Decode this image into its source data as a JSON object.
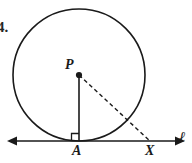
{
  "figure": {
    "type": "geometry-diagram",
    "width": 192,
    "height": 163,
    "background_color": "#ffffff",
    "stroke_color": "#1a1a1a",
    "problem_number": "4.",
    "labels": {
      "center": "P",
      "tangent_point": "A",
      "exterior_point": "X",
      "line": "ℓ"
    },
    "circle": {
      "center_x": 79,
      "center_y": 75,
      "radius": 66,
      "stroke_width": 1.6,
      "fill": "none"
    },
    "line_l": {
      "x1": 8,
      "y1": 141,
      "x2": 184,
      "y2": 141,
      "stroke_width": 1.6,
      "arrows": "both"
    },
    "radius_segment": {
      "label": "PA",
      "x1": 79,
      "y1": 75,
      "x2": 79,
      "y2": 141,
      "style": "solid",
      "stroke_width": 1.6
    },
    "dashed_segment": {
      "label": "PX",
      "x1": 79,
      "y1": 75,
      "x2": 150,
      "y2": 141,
      "style": "dashed",
      "dash_pattern": "4,3",
      "stroke_width": 1.4
    },
    "center_dot": {
      "cx": 79,
      "cy": 75,
      "r": 3.1
    },
    "right_angle_mark": {
      "at": "A",
      "size": 8,
      "stroke_width": 1.3
    }
  }
}
